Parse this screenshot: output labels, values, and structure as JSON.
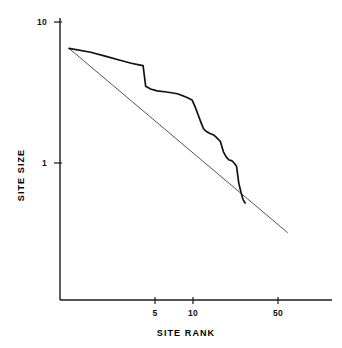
{
  "chart_data": {
    "type": "line",
    "title": "",
    "subtitle": "",
    "xlabel": "SITE RANK",
    "ylabel": "SITE SIZE",
    "xscale": "log",
    "yscale": "log",
    "xlim": [
      1,
      75
    ],
    "ylim": [
      0.28,
      11
    ],
    "grid": false,
    "legend": null,
    "xticks": [
      5,
      10,
      50
    ],
    "xtick_labels": [
      "5",
      "10",
      "50"
    ],
    "yticks": [
      1,
      10
    ],
    "ytick_labels": [
      "1",
      "10"
    ],
    "series": [
      {
        "name": "observed-site-size-rank",
        "style": "stepped",
        "color": "#111111",
        "x": [
          1,
          1.5,
          2,
          2.6,
          3.2,
          3.8,
          4.0,
          4.2,
          4.6,
          5.2,
          6.0,
          6.8,
          7.6,
          8.4,
          9.2,
          10.0,
          10.6,
          11.2,
          11.8,
          12.4,
          13.0,
          14.0,
          15.0,
          16.0,
          17.0,
          18.0,
          19.0,
          20.0,
          21.0,
          22.0,
          23.0,
          24.0,
          25.0,
          26.0,
          27.0
        ],
        "y": [
          6.5,
          6.1,
          5.7,
          5.35,
          5.1,
          4.95,
          4.9,
          3.5,
          3.35,
          3.25,
          3.2,
          3.15,
          3.1,
          3.0,
          2.9,
          2.8,
          2.5,
          2.2,
          1.95,
          1.75,
          1.68,
          1.62,
          1.58,
          1.5,
          1.42,
          1.2,
          1.1,
          1.05,
          1.04,
          1.0,
          0.95,
          0.72,
          0.62,
          0.55,
          0.52
        ]
      },
      {
        "name": "expected-broken-stick",
        "style": "straight",
        "color": "#555555",
        "x": [
          1,
          60
        ],
        "y": [
          6.5,
          0.32
        ]
      }
    ]
  },
  "axes": {
    "y_title": "SITE SIZE",
    "x_title": "SITE RANK",
    "y_tick_top": "10",
    "y_tick_bottom": "1",
    "x_tick_a": "5",
    "x_tick_b": "10",
    "x_tick_c": "50"
  },
  "colors": {
    "background": "#ffffff",
    "axis": "#1a1a1a",
    "series_observed": "#111111",
    "series_expected": "#555555"
  }
}
